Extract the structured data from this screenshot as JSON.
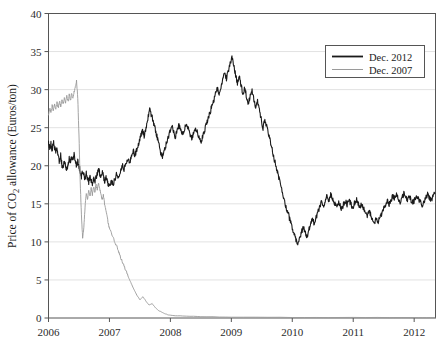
{
  "chart_data": {
    "type": "line",
    "title": "",
    "xlabel": "",
    "ylabel": "Price of CO2 allowance (Euros/ton)",
    "ylabel_parts": {
      "pre": "Price of CO",
      "sub": "2",
      "post": " allowance (Euros/ton)"
    },
    "xlim": [
      2006.0,
      2012.35
    ],
    "ylim": [
      0,
      40
    ],
    "grid": "horizontal",
    "xticks": [
      "2006",
      "2007",
      "2008",
      "2009",
      "2010",
      "2011",
      "2012"
    ],
    "xtick_values": [
      2006,
      2007,
      2008,
      2009,
      2010,
      2011,
      2012
    ],
    "yticks": [
      "0",
      "5",
      "10",
      "15",
      "20",
      "25",
      "30",
      "35",
      "40"
    ],
    "ytick_values": [
      0,
      5,
      10,
      15,
      20,
      25,
      30,
      35,
      40
    ],
    "legend_position": "top-right",
    "series": [
      {
        "name": "Dec. 2012",
        "color": "#1a1a1a",
        "width": 1.1,
        "x": [
          2006.0,
          2006.02,
          2006.04,
          2006.06,
          2006.08,
          2006.1,
          2006.12,
          2006.14,
          2006.16,
          2006.18,
          2006.2,
          2006.22,
          2006.24,
          2006.26,
          2006.28,
          2006.3,
          2006.32,
          2006.34,
          2006.36,
          2006.38,
          2006.4,
          2006.42,
          2006.44,
          2006.46,
          2006.48,
          2006.5,
          2006.52,
          2006.54,
          2006.56,
          2006.58,
          2006.6,
          2006.62,
          2006.64,
          2006.66,
          2006.68,
          2006.7,
          2006.72,
          2006.74,
          2006.76,
          2006.78,
          2006.8,
          2006.82,
          2006.84,
          2006.86,
          2006.88,
          2006.9,
          2006.92,
          2006.94,
          2006.96,
          2006.98,
          2007.0,
          2007.03,
          2007.06,
          2007.09,
          2007.12,
          2007.15,
          2007.18,
          2007.21,
          2007.24,
          2007.27,
          2007.3,
          2007.33,
          2007.36,
          2007.39,
          2007.42,
          2007.45,
          2007.48,
          2007.51,
          2007.54,
          2007.57,
          2007.6,
          2007.63,
          2007.66,
          2007.69,
          2007.72,
          2007.75,
          2007.78,
          2007.81,
          2007.84,
          2007.87,
          2007.9,
          2007.93,
          2007.96,
          2007.99,
          2008.02,
          2008.05,
          2008.08,
          2008.11,
          2008.14,
          2008.17,
          2008.2,
          2008.23,
          2008.26,
          2008.29,
          2008.32,
          2008.35,
          2008.38,
          2008.41,
          2008.44,
          2008.47,
          2008.5,
          2008.53,
          2008.56,
          2008.59,
          2008.62,
          2008.65,
          2008.68,
          2008.71,
          2008.74,
          2008.77,
          2008.8,
          2008.83,
          2008.86,
          2008.89,
          2008.92,
          2008.95,
          2008.98,
          2009.01,
          2009.04,
          2009.07,
          2009.1,
          2009.13,
          2009.16,
          2009.19,
          2009.22,
          2009.25,
          2009.28,
          2009.31,
          2009.34,
          2009.37,
          2009.4,
          2009.43,
          2009.46,
          2009.49,
          2009.52,
          2009.55,
          2009.58,
          2009.61,
          2009.64,
          2009.67,
          2009.7,
          2009.73,
          2009.76,
          2009.79,
          2009.82,
          2009.85,
          2009.88,
          2009.91,
          2009.94,
          2009.97,
          2010.0,
          2010.03,
          2010.06,
          2010.09,
          2010.12,
          2010.15,
          2010.18,
          2010.21,
          2010.24,
          2010.27,
          2010.3,
          2010.33,
          2010.36,
          2010.39,
          2010.42,
          2010.45,
          2010.48,
          2010.51,
          2010.54,
          2010.57,
          2010.6,
          2010.63,
          2010.66,
          2010.69,
          2010.72,
          2010.75,
          2010.78,
          2010.81,
          2010.84,
          2010.87,
          2010.9,
          2010.93,
          2010.96,
          2010.99,
          2011.02,
          2011.05,
          2011.08,
          2011.11,
          2011.14,
          2011.17,
          2011.2,
          2011.23,
          2011.26,
          2011.29,
          2011.32,
          2011.35,
          2011.38,
          2011.41,
          2011.44,
          2011.47,
          2011.5,
          2011.53,
          2011.56,
          2011.59,
          2011.62,
          2011.65,
          2011.68,
          2011.71,
          2011.74,
          2011.77,
          2011.8,
          2011.83,
          2011.86,
          2011.89,
          2011.92,
          2011.95,
          2011.98,
          2012.01,
          2012.04,
          2012.07,
          2012.1,
          2012.13,
          2012.16,
          2012.19,
          2012.22,
          2012.25,
          2012.28,
          2012.31,
          2012.34
        ],
        "y": [
          23.0,
          22.3,
          22.9,
          22.1,
          23.2,
          22.4,
          21.8,
          22.5,
          21.2,
          20.3,
          21.4,
          20.1,
          19.8,
          20.6,
          20.0,
          19.4,
          20.2,
          21.0,
          20.4,
          21.1,
          20.8,
          21.5,
          20.7,
          19.9,
          20.6,
          20.0,
          19.3,
          18.6,
          19.4,
          18.8,
          18.2,
          19.0,
          18.4,
          17.9,
          18.6,
          18.0,
          17.5,
          18.3,
          17.8,
          18.5,
          18.9,
          19.6,
          19.0,
          18.4,
          19.2,
          18.7,
          17.9,
          18.6,
          18.1,
          17.6,
          17.3,
          18.1,
          17.5,
          18.3,
          19.0,
          18.4,
          19.2,
          20.1,
          19.5,
          20.3,
          21.0,
          20.4,
          21.2,
          22.0,
          21.4,
          22.2,
          23.0,
          23.8,
          24.5,
          23.9,
          25.0,
          26.2,
          27.4,
          26.6,
          25.8,
          24.9,
          23.9,
          22.8,
          21.8,
          21.2,
          22.0,
          22.8,
          23.6,
          24.4,
          25.2,
          24.6,
          23.8,
          24.5,
          25.3,
          24.7,
          24.1,
          24.8,
          25.5,
          24.9,
          24.2,
          23.5,
          24.3,
          25.0,
          24.4,
          23.7,
          23.0,
          23.8,
          24.6,
          25.4,
          26.2,
          27.0,
          27.8,
          28.6,
          29.4,
          30.2,
          29.5,
          30.4,
          31.3,
          32.2,
          31.4,
          32.5,
          33.4,
          34.2,
          33.1,
          31.9,
          30.9,
          31.8,
          30.6,
          29.4,
          30.2,
          29.0,
          28.2,
          29.1,
          29.9,
          28.8,
          27.6,
          28.5,
          27.3,
          26.1,
          25.0,
          26.0,
          25.2,
          24.2,
          23.2,
          22.1,
          21.0,
          20.0,
          19.0,
          18.0,
          17.0,
          16.0,
          15.2,
          14.3,
          13.5,
          12.6,
          11.8,
          11.0,
          10.3,
          9.6,
          10.4,
          11.2,
          12.0,
          11.3,
          10.6,
          11.5,
          12.3,
          13.0,
          12.4,
          13.2,
          13.9,
          14.6,
          15.3,
          14.7,
          15.4,
          16.0,
          15.5,
          16.2,
          15.7,
          15.1,
          14.6,
          15.2,
          14.8,
          14.3,
          14.9,
          15.4,
          14.9,
          15.5,
          15.0,
          14.5,
          15.1,
          15.6,
          15.0,
          14.5,
          15.0,
          14.4,
          13.9,
          13.4,
          14.0,
          13.5,
          13.0,
          12.6,
          13.1,
          12.7,
          13.2,
          13.8,
          14.3,
          14.9,
          15.4,
          14.9,
          15.5,
          16.0,
          15.6,
          16.1,
          15.7,
          15.3,
          15.8,
          16.3,
          15.9,
          15.4,
          16.0,
          15.5,
          15.1,
          15.6,
          16.1,
          15.7,
          15.2,
          14.8,
          15.3,
          15.8,
          16.2,
          15.8,
          15.4,
          15.9,
          16.4
        ],
        "note": "series values continue in y_tail"
      },
      {
        "name": "Dec. 2007",
        "color": "#999999",
        "width": 0.9,
        "x": [
          2006.0,
          2006.02,
          2006.04,
          2006.06,
          2006.08,
          2006.1,
          2006.12,
          2006.14,
          2006.16,
          2006.18,
          2006.2,
          2006.22,
          2006.24,
          2006.26,
          2006.28,
          2006.3,
          2006.32,
          2006.34,
          2006.36,
          2006.38,
          2006.4,
          2006.42,
          2006.44,
          2006.46,
          2006.48,
          2006.5,
          2006.52,
          2006.54,
          2006.56,
          2006.58,
          2006.6,
          2006.62,
          2006.64,
          2006.66,
          2006.68,
          2006.7,
          2006.72,
          2006.74,
          2006.76,
          2006.78,
          2006.8,
          2006.82,
          2006.84,
          2006.86,
          2006.88,
          2006.9,
          2006.92,
          2006.94,
          2006.96,
          2006.98,
          2007.0,
          2007.04,
          2007.08,
          2007.12,
          2007.16,
          2007.2,
          2007.24,
          2007.28,
          2007.32,
          2007.36,
          2007.4,
          2007.45,
          2007.5,
          2007.55,
          2007.6,
          2007.65,
          2007.7,
          2007.75,
          2007.8,
          2007.85,
          2007.9,
          2007.95,
          2008.0,
          2008.2,
          2008.5,
          2009.0,
          2010.0,
          2011.0,
          2012.0,
          2012.34
        ],
        "y": [
          26.8,
          27.6,
          26.9,
          27.9,
          27.2,
          28.1,
          27.4,
          28.3,
          27.6,
          28.5,
          27.8,
          28.7,
          28.0,
          28.9,
          28.2,
          29.1,
          28.4,
          29.3,
          28.6,
          29.5,
          28.8,
          29.8,
          30.3,
          31.1,
          29.0,
          24.0,
          18.0,
          13.5,
          10.5,
          12.0,
          14.5,
          16.5,
          15.5,
          16.8,
          16.0,
          17.0,
          16.2,
          17.2,
          16.5,
          17.5,
          16.8,
          17.8,
          17.0,
          16.2,
          15.5,
          16.2,
          15.0,
          14.2,
          13.4,
          12.5,
          11.8,
          11.0,
          10.2,
          9.4,
          8.5,
          7.6,
          6.8,
          6.0,
          5.2,
          4.5,
          3.8,
          3.0,
          2.4,
          2.8,
          2.2,
          1.7,
          1.9,
          1.4,
          1.0,
          0.8,
          0.6,
          0.45,
          0.35,
          0.25,
          0.18,
          0.12,
          0.08,
          0.06,
          0.05,
          0.05
        ]
      }
    ]
  },
  "legend": {
    "entries": [
      {
        "label": "Dec. 2012",
        "color": "#1a1a1a",
        "width": 1.8
      },
      {
        "label": "Dec. 2007",
        "color": "#9a9a9a",
        "width": 1.0
      }
    ]
  },
  "axes": {
    "frame_color": "#555555",
    "grid_color": "#e2e2e2",
    "tick_color": "#555555"
  }
}
